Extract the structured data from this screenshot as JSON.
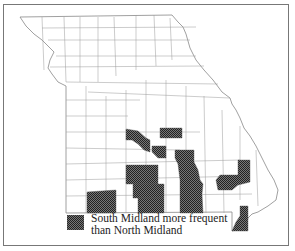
{
  "map": {
    "region": "Missouri counties",
    "fill_color": "#4a4a4a",
    "outline_color": "#888888"
  },
  "legend": {
    "line1": "South Midland more frequent",
    "line2": "than North Midland"
  }
}
